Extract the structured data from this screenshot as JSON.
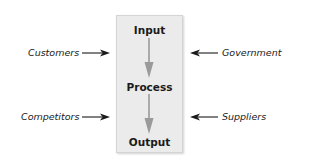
{
  "diagram": {
    "type": "process-flow",
    "box": {
      "fill": "#ebebeb",
      "border": "#d4d4d4"
    },
    "stages": [
      {
        "label": "Input"
      },
      {
        "label": "Process"
      },
      {
        "label": "Output"
      }
    ],
    "flow_arrow_color": "#9a9a9a",
    "external_arrow_color": "#1a1a1a",
    "left_inputs": [
      {
        "label": "Customers",
        "direction": "right"
      },
      {
        "label": "Competitors",
        "direction": "right"
      }
    ],
    "right_inputs": [
      {
        "label": "Government",
        "direction": "left"
      },
      {
        "label": "Suppliers",
        "direction": "left"
      }
    ],
    "edges": [
      {
        "from": "Input",
        "to": "Process"
      },
      {
        "from": "Process",
        "to": "Output"
      },
      {
        "from": "Customers",
        "to": "box"
      },
      {
        "from": "Competitors",
        "to": "box"
      },
      {
        "from": "Government",
        "to": "box"
      },
      {
        "from": "Suppliers",
        "to": "box"
      }
    ]
  }
}
